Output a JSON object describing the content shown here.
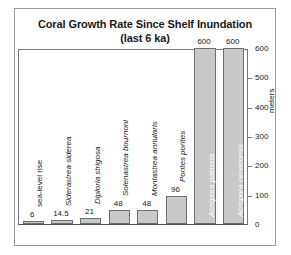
{
  "chart_data": {
    "type": "bar",
    "title": "Coral Growth Rate Since Shelf Inundation",
    "subtitle": "(last 6 ka)",
    "xlabel": "",
    "ylabel": "meters",
    "ylim": [
      0,
      600
    ],
    "yticks": [
      0,
      100,
      200,
      300,
      400,
      500,
      600
    ],
    "grid": false,
    "legend": "none",
    "categories": [
      "sea-level rise",
      "Siderastrea siderea",
      "Diploria strigosa",
      "Solenastrea bournoni",
      "Montastrea annularis",
      "Porites porites",
      "Acropora palmata",
      "Acropora cervicornis"
    ],
    "values": [
      6,
      14.5,
      21,
      48,
      48,
      96,
      600,
      600
    ],
    "value_labels": [
      "6",
      "14.5",
      "21",
      "48",
      "48",
      "96",
      "600",
      "600"
    ],
    "label_styles": [
      "plain",
      "italic",
      "italic",
      "italic",
      "italic",
      "italic",
      "italic",
      "italic"
    ],
    "label_placement": [
      "outside",
      "outside",
      "outside",
      "outside",
      "outside",
      "outside",
      "inside",
      "inside"
    ],
    "bar_color": "#c9c9c9",
    "bar_border_color": "#6f6f6f",
    "inside_label_color": "#ffffff"
  },
  "figure": {
    "border_color": "#9a9a9a",
    "background": "#ffffff"
  }
}
